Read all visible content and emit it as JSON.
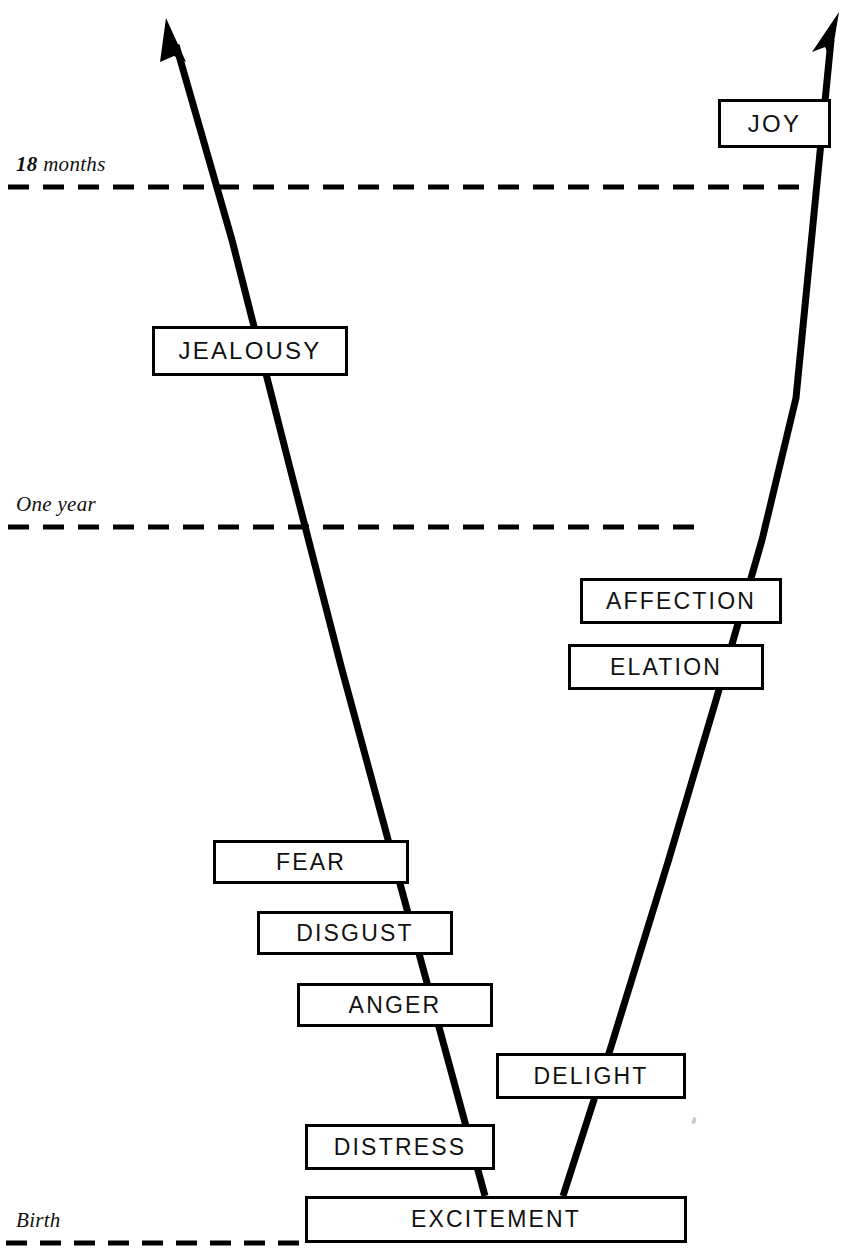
{
  "diagram": {
    "type": "branching-timeline",
    "canvas": {
      "width": 853,
      "height": 1260
    },
    "colors": {
      "ink": "#000000",
      "text": "#111111",
      "background": "#ffffff"
    }
  },
  "time_markers": [
    {
      "id": "eighteen-months",
      "label_number": "18",
      "label_rest": " months",
      "label_full": "18 months",
      "y": 187,
      "line_start_x": 8,
      "line_end_x": 805,
      "label_x": 16,
      "label_y": 152
    },
    {
      "id": "one-year",
      "label_number": "",
      "label_rest": "One year",
      "label_full": "One year",
      "y": 527,
      "line_start_x": 8,
      "line_end_x": 694,
      "label_x": 16,
      "label_y": 492
    },
    {
      "id": "birth",
      "label_number": "",
      "label_rest": "Birth",
      "label_full": "Birth",
      "y": 1243,
      "line_start_x": 6,
      "line_end_x": 305,
      "label_x": 16,
      "label_y": 1208
    }
  ],
  "branches": {
    "negative": {
      "name": "negative-emotions-branch",
      "from": "EXCITEMENT",
      "tip": "JEALOUSY",
      "points": [
        [
          485,
          1196
        ],
        [
          399,
          880
        ],
        [
          341,
          666
        ],
        [
          290,
          468
        ],
        [
          232,
          240
        ],
        [
          171,
          32
        ]
      ]
    },
    "positive": {
      "name": "positive-emotions-branch",
      "from": "EXCITEMENT",
      "tip": "JOY",
      "points": [
        [
          563,
          1196
        ],
        [
          610,
          1050
        ],
        [
          668,
          862
        ],
        [
          716,
          700
        ],
        [
          762,
          540
        ],
        [
          800,
          400
        ],
        [
          836,
          24
        ]
      ]
    }
  },
  "emotions": [
    {
      "id": "joy",
      "label": "JOY",
      "x": 718,
      "y": 99,
      "w": 113,
      "h": 49,
      "font_size": 24,
      "branch": "positive"
    },
    {
      "id": "jealousy",
      "label": "JEALOUSY",
      "x": 152,
      "y": 326,
      "w": 196,
      "h": 50,
      "font_size": 24,
      "branch": "negative"
    },
    {
      "id": "affection",
      "label": "AFFECTION",
      "x": 580,
      "y": 578,
      "w": 202,
      "h": 46,
      "font_size": 23,
      "branch": "positive"
    },
    {
      "id": "elation",
      "label": "ELATION",
      "x": 568,
      "y": 644,
      "w": 196,
      "h": 46,
      "font_size": 23,
      "branch": "positive"
    },
    {
      "id": "fear",
      "label": "FEAR",
      "x": 213,
      "y": 840,
      "w": 196,
      "h": 44,
      "font_size": 23,
      "branch": "negative"
    },
    {
      "id": "disgust",
      "label": "DISGUST",
      "x": 257,
      "y": 911,
      "w": 196,
      "h": 44,
      "font_size": 23,
      "branch": "negative"
    },
    {
      "id": "anger",
      "label": "ANGER",
      "x": 297,
      "y": 983,
      "w": 196,
      "h": 44,
      "font_size": 23,
      "branch": "negative"
    },
    {
      "id": "delight",
      "label": "DELIGHT",
      "x": 496,
      "y": 1053,
      "w": 190,
      "h": 46,
      "font_size": 23,
      "branch": "positive"
    },
    {
      "id": "distress",
      "label": "DISTRESS",
      "x": 305,
      "y": 1124,
      "w": 190,
      "h": 46,
      "font_size": 23,
      "branch": "negative"
    },
    {
      "id": "excitement",
      "label": "EXCITEMENT",
      "x": 305,
      "y": 1196,
      "w": 382,
      "h": 47,
      "font_size": 23,
      "branch": "root"
    }
  ]
}
